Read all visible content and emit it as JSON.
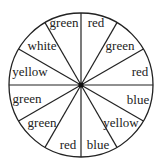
{
  "spinner": {
    "center": {
      "x": 81,
      "y": 85
    },
    "radius": 72,
    "sector_count": 12,
    "stroke_color": "#222222",
    "background": "#ffffff",
    "sectors": [
      {
        "label": "red",
        "start_deg": 0,
        "end_deg": 30,
        "text_x": 96,
        "text_y": 27
      },
      {
        "label": "green",
        "start_deg": 30,
        "end_deg": 60,
        "text_x": 120,
        "text_y": 50
      },
      {
        "label": "red",
        "start_deg": 60,
        "end_deg": 90,
        "text_x": 140,
        "text_y": 76
      },
      {
        "label": "blue",
        "start_deg": 90,
        "end_deg": 120,
        "text_x": 138,
        "text_y": 104
      },
      {
        "label": "yellow",
        "start_deg": 120,
        "end_deg": 150,
        "text_x": 121,
        "text_y": 127
      },
      {
        "label": "blue",
        "start_deg": 150,
        "end_deg": 180,
        "text_x": 98,
        "text_y": 149
      },
      {
        "label": "red",
        "start_deg": 180,
        "end_deg": 210,
        "text_x": 68,
        "text_y": 149
      },
      {
        "label": "green",
        "start_deg": 210,
        "end_deg": 240,
        "text_x": 42,
        "text_y": 127
      },
      {
        "label": "green",
        "start_deg": 240,
        "end_deg": 270,
        "text_x": 27,
        "text_y": 103
      },
      {
        "label": "yellow",
        "start_deg": 270,
        "end_deg": 300,
        "text_x": 30,
        "text_y": 76
      },
      {
        "label": "white",
        "start_deg": 300,
        "end_deg": 330,
        "text_x": 42,
        "text_y": 50
      },
      {
        "label": "green",
        "start_deg": 330,
        "end_deg": 360,
        "text_x": 64,
        "text_y": 27
      }
    ]
  }
}
